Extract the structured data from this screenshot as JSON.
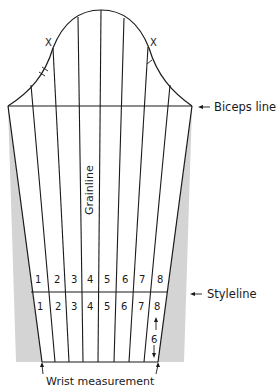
{
  "diagram": {
    "labels": {
      "biceps_line": "Biceps line",
      "styleline": "Styleline",
      "grainline": "Grainline",
      "wrist_measurement": "Wrist measurement",
      "cap_mark_left": "X",
      "cap_mark_right": "X",
      "spread_amount": "6"
    },
    "upper_panel_numbers": [
      "1",
      "2",
      "3",
      "4",
      "5",
      "6",
      "7",
      "8"
    ],
    "lower_panel_numbers": [
      "1",
      "2",
      "3",
      "4",
      "5",
      "6",
      "7",
      "8"
    ],
    "colors": {
      "line": "#1a1a1a",
      "shading": "#d4d4d4",
      "background": "#ffffff"
    }
  }
}
